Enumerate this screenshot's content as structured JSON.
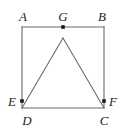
{
  "figure": {
    "type": "geometry-diagram",
    "canvas": {
      "width": 124,
      "height": 138
    },
    "background_color": "#ffffff",
    "stroke_color": "#6b6b6b",
    "label_color": "#1c1c1c",
    "point_color": "#1a1a1a",
    "square": {
      "name": "ABCD",
      "top_left": {
        "x": 22,
        "y": 27
      },
      "top_right": {
        "x": 104,
        "y": 27
      },
      "bottom_right": {
        "x": 104,
        "y": 108
      },
      "bottom_left": {
        "x": 22,
        "y": 108
      }
    },
    "triangle": {
      "name": "GDC",
      "apex": {
        "x": 63,
        "y": 38
      },
      "left_base": {
        "x": 22,
        "y": 108
      },
      "right_base": {
        "x": 104,
        "y": 108
      }
    },
    "marked_points": [
      {
        "id": "G",
        "label": "G",
        "x": 63,
        "y": 27,
        "label_x": 63,
        "label_y": 16
      },
      {
        "id": "E",
        "label": "E",
        "x": 22,
        "y": 101,
        "label_x": 12,
        "label_y": 101
      },
      {
        "id": "F",
        "label": "F",
        "x": 104,
        "y": 101,
        "label_x": 113,
        "label_y": 101
      }
    ],
    "labels": [
      {
        "id": "A",
        "text": "A",
        "x": 23,
        "y": 16
      },
      {
        "id": "G",
        "text": "G",
        "x": 63,
        "y": 16
      },
      {
        "id": "B",
        "text": "B",
        "x": 102,
        "y": 16
      },
      {
        "id": "E",
        "text": "E",
        "x": 12,
        "y": 101
      },
      {
        "id": "F",
        "text": "F",
        "x": 113,
        "y": 101
      },
      {
        "id": "D",
        "text": "D",
        "x": 27,
        "y": 120
      },
      {
        "id": "C",
        "text": "C",
        "x": 104,
        "y": 120
      }
    ]
  }
}
